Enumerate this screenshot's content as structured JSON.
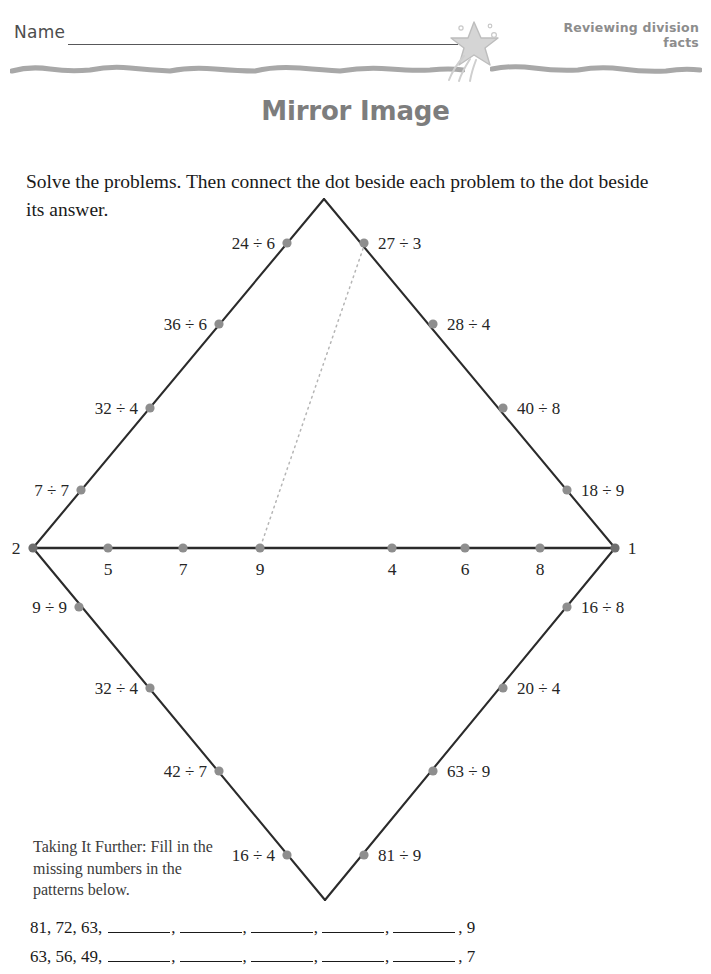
{
  "header": {
    "name_label": "Name",
    "topic_line1": "Reviewing division",
    "topic_line2": "facts",
    "star_icon": "shooting-star-icon"
  },
  "title": "Mirror Image",
  "directions": "Solve the problems. Then connect the dot beside each problem to the dot beside its answer.",
  "diagram": {
    "geometry": {
      "top_vertex": [
        324,
        14
      ],
      "left_vertex": [
        33,
        363
      ],
      "right_vertex": [
        615,
        363
      ],
      "bottom_vertex": [
        325,
        715
      ],
      "example_line_from": [
        365,
        58
      ],
      "example_line_to": [
        260,
        363
      ]
    },
    "upper_left_problems": [
      {
        "label": "24 ÷ 6",
        "dot": [
          287,
          58
        ],
        "text_anchor": "end",
        "text_pos": [
          275,
          64
        ]
      },
      {
        "label": "36 ÷ 6",
        "dot": [
          219,
          139
        ],
        "text_anchor": "end",
        "text_pos": [
          207,
          145
        ]
      },
      {
        "label": "32 ÷ 4",
        "dot": [
          150,
          223
        ],
        "text_anchor": "end",
        "text_pos": [
          138,
          229
        ]
      },
      {
        "label": "7 ÷ 7",
        "dot": [
          81,
          305
        ],
        "text_anchor": "end",
        "text_pos": [
          69,
          311
        ]
      }
    ],
    "upper_right_problems": [
      {
        "label": "27 ÷ 3",
        "dot": [
          364,
          58
        ],
        "text_anchor": "start",
        "text_pos": [
          378,
          64
        ]
      },
      {
        "label": "28 ÷ 4",
        "dot": [
          433,
          139
        ],
        "text_anchor": "start",
        "text_pos": [
          447,
          145
        ]
      },
      {
        "label": "40 ÷ 8",
        "dot": [
          503,
          223
        ],
        "text_anchor": "start",
        "text_pos": [
          517,
          229
        ]
      },
      {
        "label": "18 ÷ 9",
        "dot": [
          567,
          305
        ],
        "text_anchor": "start",
        "text_pos": [
          581,
          311
        ]
      }
    ],
    "lower_left_problems": [
      {
        "label": "9 ÷ 9",
        "dot": [
          79,
          422
        ],
        "text_anchor": "end",
        "text_pos": [
          67,
          428
        ]
      },
      {
        "label": "32 ÷ 4",
        "dot": [
          150,
          503
        ],
        "text_anchor": "end",
        "text_pos": [
          138,
          509
        ]
      },
      {
        "label": "42 ÷ 7",
        "dot": [
          219,
          586
        ],
        "text_anchor": "end",
        "text_pos": [
          207,
          592
        ]
      },
      {
        "label": "16 ÷ 4",
        "dot": [
          287,
          670
        ],
        "text_anchor": "end",
        "text_pos": [
          275,
          676
        ]
      }
    ],
    "lower_right_problems": [
      {
        "label": "16 ÷ 8",
        "dot": [
          567,
          422
        ],
        "text_anchor": "start",
        "text_pos": [
          581,
          428
        ]
      },
      {
        "label": "20 ÷ 4",
        "dot": [
          503,
          503
        ],
        "text_anchor": "start",
        "text_pos": [
          517,
          509
        ]
      },
      {
        "label": "63 ÷ 9",
        "dot": [
          433,
          586
        ],
        "text_anchor": "start",
        "text_pos": [
          447,
          592
        ]
      },
      {
        "label": "81 ÷ 9",
        "dot": [
          364,
          670
        ],
        "text_anchor": "start",
        "text_pos": [
          378,
          676
        ]
      }
    ],
    "axis_answers": [
      {
        "label": "5",
        "dot": [
          108,
          363
        ],
        "text_pos": [
          108,
          390
        ]
      },
      {
        "label": "7",
        "dot": [
          183,
          363
        ],
        "text_pos": [
          183,
          390
        ]
      },
      {
        "label": "9",
        "dot": [
          260,
          363
        ],
        "text_pos": [
          260,
          390
        ]
      },
      {
        "label": "4",
        "dot": [
          392,
          363
        ],
        "text_pos": [
          392,
          390
        ]
      },
      {
        "label": "6",
        "dot": [
          465,
          363
        ],
        "text_pos": [
          465,
          390
        ]
      },
      {
        "label": "8",
        "dot": [
          540,
          363
        ],
        "text_pos": [
          540,
          390
        ]
      }
    ],
    "left_vertex_answer": {
      "label": "2",
      "text_pos": [
        16,
        369
      ]
    },
    "right_vertex_answer": {
      "label": "1",
      "text_pos": [
        632,
        369
      ]
    }
  },
  "taking_further": "Taking It Further: Fill in the missing numbers in the patterns below.",
  "patterns": [
    {
      "start": "81,  72,  63,",
      "blanks": 5,
      "end": ", 9"
    },
    {
      "start": "63, 56, 49,",
      "blanks": 5,
      "end": ", 7"
    }
  ],
  "colors": {
    "ink": "#231f20",
    "dot_gray": "#8e8e8e",
    "title_gray": "#7d7d7d",
    "header_gray": "#8d8d8d",
    "rule_gray": "#a8a8a8",
    "example_gray": "#b5b5b5"
  }
}
